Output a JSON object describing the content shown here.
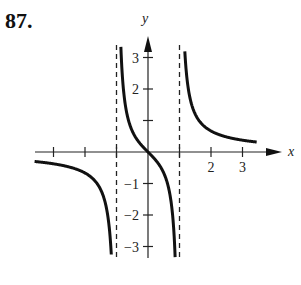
{
  "problem": {
    "number": "87."
  },
  "chart_data": {
    "type": "line",
    "title": "",
    "function": "y = x/(x^2 - 1)",
    "xlabel": "x",
    "ylabel": "y",
    "xlim": [
      -3.6,
      3.6
    ],
    "ylim": [
      -3.5,
      3.5
    ],
    "x_ticks": [
      -3,
      -2,
      -1,
      1,
      2,
      3
    ],
    "x_tick_labels": [
      "",
      "",
      "",
      "",
      "2",
      "3"
    ],
    "y_ticks": [
      -3,
      -2,
      -1,
      1,
      2,
      3
    ],
    "y_tick_labels": [
      "−3",
      "−2",
      "−1",
      "",
      "2",
      "3"
    ],
    "vertical_asymptotes": [
      -1,
      1
    ],
    "horizontal_asymptote": 0,
    "grid": false,
    "series": [
      {
        "name": "left branch",
        "x": [
          -3.5,
          -3,
          -2,
          -1.5,
          -1.2,
          -1.1,
          -1.05
        ],
        "y": [
          -0.31,
          -0.375,
          -0.667,
          -1.2,
          -2.73,
          -5.24,
          -10.2
        ]
      },
      {
        "name": "middle branch",
        "x": [
          -0.85,
          -0.7,
          -0.5,
          -0.25,
          0,
          0.25,
          0.5,
          0.7,
          0.85
        ],
        "y": [
          3.06,
          1.37,
          0.667,
          0.267,
          0,
          -0.267,
          -0.667,
          -1.37,
          -3.06
        ]
      },
      {
        "name": "right branch",
        "x": [
          1.05,
          1.1,
          1.2,
          1.5,
          2,
          3,
          3.5
        ],
        "y": [
          10.2,
          5.24,
          2.73,
          1.2,
          0.667,
          0.375,
          0.31
        ]
      }
    ]
  }
}
